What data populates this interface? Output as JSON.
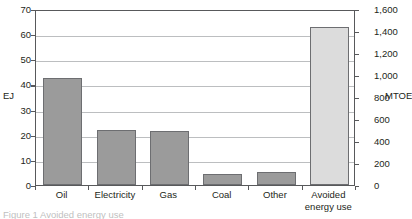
{
  "chart_data": {
    "type": "bar",
    "title": "",
    "categories": [
      "Oil",
      "Electricity",
      "Gas",
      "Coal",
      "Other",
      "Avoided energy use"
    ],
    "values": [
      42.5,
      22.0,
      21.5,
      4.5,
      5.0,
      63.0
    ],
    "values_mtoe": [
      1015,
      525,
      514,
      108,
      119,
      1505
    ],
    "series": [
      {
        "name": "Energy",
        "values": [
          42.5,
          22.0,
          21.5,
          4.5,
          5.0,
          63.0
        ]
      }
    ],
    "xlabel": "",
    "ylabel": "EJ",
    "y2label": "MTOE",
    "ylim": [
      0,
      70
    ],
    "y2lim": [
      0,
      1600
    ],
    "yticks": [
      "0",
      "10",
      "20",
      "30",
      "40",
      "50",
      "60",
      "70"
    ],
    "y2ticks": [
      "0",
      "200",
      "400",
      "600",
      "800",
      "1,000",
      "1,200",
      "1,400",
      "1,600"
    ],
    "grid": true,
    "legend": "none",
    "bar_colors": [
      "#9b9b9b",
      "#9b9b9b",
      "#9b9b9b",
      "#9b9b9b",
      "#9b9b9b",
      "#dcdcdc"
    ],
    "bar_border_color": "#6d6e71",
    "axis_color": "#58595b",
    "gridline_color": "#bcbec0",
    "background": "#ffffff"
  },
  "axes": {
    "left": {
      "unit": "EJ",
      "ticks": [
        {
          "label": "70",
          "value": 70
        },
        {
          "label": "60",
          "value": 60
        },
        {
          "label": "50",
          "value": 50
        },
        {
          "label": "40",
          "value": 40
        },
        {
          "label": "30",
          "value": 30
        },
        {
          "label": "20",
          "value": 20
        },
        {
          "label": "10",
          "value": 10
        },
        {
          "label": "0",
          "value": 0
        }
      ]
    },
    "right": {
      "unit": "MTOE",
      "ticks": [
        {
          "label": "1,600",
          "value": 1600
        },
        {
          "label": "1,400",
          "value": 1400
        },
        {
          "label": "1,200",
          "value": 1200
        },
        {
          "label": "1,000",
          "value": 1000
        },
        {
          "label": "800",
          "value": 800
        },
        {
          "label": "600",
          "value": 600
        },
        {
          "label": "400",
          "value": 400
        },
        {
          "label": "200",
          "value": 200
        },
        {
          "label": "0",
          "value": 0
        }
      ]
    }
  },
  "categories": [
    {
      "label": "Oil",
      "line1": "Oil",
      "line2": ""
    },
    {
      "label": "Electricity",
      "line1": "Electricity",
      "line2": ""
    },
    {
      "label": "Gas",
      "line1": "Gas",
      "line2": ""
    },
    {
      "label": "Coal",
      "line1": "Coal",
      "line2": ""
    },
    {
      "label": "Other",
      "line1": "Other",
      "line2": ""
    },
    {
      "label": "Avoided energy use",
      "line1": "Avoided",
      "line2": "energy use"
    }
  ],
  "caption": {
    "cut_off_text": "Figure 1  Avoided energy use"
  }
}
